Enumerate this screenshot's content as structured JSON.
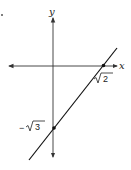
{
  "diagram": {
    "type": "coordinate-plane-line",
    "marker_dot": "•",
    "axes": {
      "x_label": "x",
      "y_label": "y"
    },
    "line": {
      "x_intercept_label": "√2",
      "y_intercept_label": "−√3",
      "x_intercept_radicand": "2",
      "y_intercept_sign": "−",
      "y_intercept_radicand": "3"
    },
    "colors": {
      "axis": "#333333",
      "line": "#111111",
      "background": "#ffffff"
    }
  }
}
